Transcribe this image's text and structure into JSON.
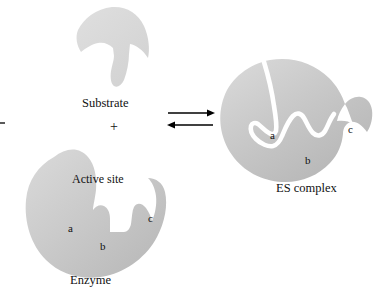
{
  "figure": {
    "background_color": "#ffffff",
    "width": 382,
    "height": 303
  },
  "palette": {
    "shape_fill_light": "#d2d2d2",
    "shape_fill_mid": "#c6c6c6",
    "shape_fill_dark": "#b4b4b4",
    "substrate_fill": "#d8d8d8",
    "outline": "#ffffff",
    "text": "#111111",
    "arrow": "#000000"
  },
  "labels": {
    "substrate": "Substrate",
    "plus": "+",
    "active_site": "Active site",
    "enzyme": "Enzyme",
    "es_complex": "ES complex"
  },
  "enzyme_sites": {
    "a": "a",
    "b": "b",
    "c": "c"
  },
  "complex_sites": {
    "a": "a",
    "b": "b",
    "c": "c"
  },
  "reaction_arrows": {
    "forward": "right-arrow",
    "reverse": "left-arrow",
    "type": "equilibrium"
  }
}
